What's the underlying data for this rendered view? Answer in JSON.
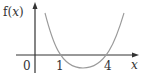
{
  "diagram": {
    "y_axis_label": "f(x)",
    "x_axis_label": "x",
    "tick_labels": [
      "0",
      "1",
      "4"
    ],
    "curve": {
      "type": "parabola",
      "roots": [
        1,
        4
      ],
      "opens": "up",
      "color": "#9a9a9a"
    },
    "axis_color": "#333333"
  }
}
